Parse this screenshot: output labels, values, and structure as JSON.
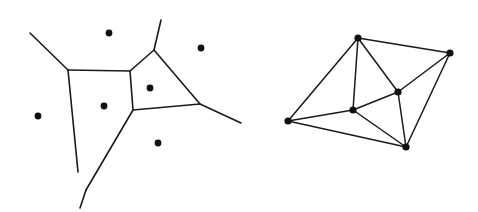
{
  "figure": {
    "background_color": "#ffffff",
    "line_color": "#1a1a1a",
    "dot_color": "#111111",
    "width": 478,
    "height": 212
  },
  "panels": [
    {
      "id": "voronoi",
      "name": "Voronoi diagram",
      "caption": ""
    },
    {
      "id": "delaunay",
      "name": "Delaunay triangulation",
      "caption": ""
    }
  ],
  "chart_data": {
    "type": "scatter",
    "xlabel": "",
    "ylabel": "",
    "xlim": [
      0,
      478
    ],
    "ylim": [
      0,
      212
    ],
    "grid": false,
    "legend": "none",
    "panels": [
      {
        "id": "voronoi",
        "label": "Voronoi diagram",
        "sites": [
          {
            "id": "s1",
            "label": "site-top",
            "x": 109,
            "y": 33,
            "r": 3.4
          },
          {
            "id": "s2",
            "label": "site-upper-right",
            "x": 201,
            "y": 48,
            "r": 3.4
          },
          {
            "id": "s3",
            "label": "site-center-right",
            "x": 150,
            "y": 88,
            "r": 3.4
          },
          {
            "id": "s4",
            "label": "site-center-left",
            "x": 104,
            "y": 106,
            "r": 3.4
          },
          {
            "id": "s5",
            "label": "site-left",
            "x": 38,
            "y": 116,
            "r": 3.4
          },
          {
            "id": "s6",
            "label": "site-bottom",
            "x": 158,
            "y": 143,
            "r": 3.4
          }
        ],
        "vertices": [
          {
            "id": "v1",
            "label": "vertex-upper-left",
            "x": 68,
            "y": 70
          },
          {
            "id": "v2",
            "label": "vertex-upper-mid",
            "x": 130,
            "y": 71
          },
          {
            "id": "v3",
            "label": "vertex-top",
            "x": 154,
            "y": 50
          },
          {
            "id": "v4",
            "label": "vertex-center",
            "x": 133,
            "y": 110
          },
          {
            "id": "v5",
            "label": "vertex-right",
            "x": 200,
            "y": 104
          },
          {
            "id": "v6",
            "label": "vertex-bottom",
            "x": 86,
            "y": 190
          }
        ],
        "edges": [
          {
            "id": "e1",
            "label": "edge-v1-v2",
            "from": [
              68,
              70
            ],
            "to": [
              130,
              71
            ]
          },
          {
            "id": "e2",
            "label": "edge-v2-v3",
            "from": [
              130,
              71
            ],
            "to": [
              154,
              50
            ]
          },
          {
            "id": "e3",
            "label": "edge-v2-v4",
            "from": [
              130,
              71
            ],
            "to": [
              133,
              110
            ]
          },
          {
            "id": "e4",
            "label": "edge-v3-v5",
            "from": [
              154,
              50
            ],
            "to": [
              200,
              104
            ]
          },
          {
            "id": "e5",
            "label": "edge-v4-v5",
            "from": [
              133,
              110
            ],
            "to": [
              200,
              104
            ]
          },
          {
            "id": "e6",
            "label": "edge-v4-v6",
            "from": [
              133,
              110
            ],
            "to": [
              86,
              190
            ]
          },
          {
            "id": "e7",
            "label": "edge-v1-v6",
            "from": [
              68,
              70
            ],
            "to": [
              78,
              172
            ]
          }
        ],
        "rays": [
          {
            "id": "r1",
            "label": "ray-upper-left",
            "from": [
              68,
              70
            ],
            "to": [
              30,
              33
            ]
          },
          {
            "id": "r2",
            "label": "ray-top",
            "from": [
              154,
              50
            ],
            "to": [
              161,
              20
            ]
          },
          {
            "id": "r3",
            "label": "ray-right",
            "from": [
              200,
              104
            ],
            "to": [
              241,
              123
            ]
          },
          {
            "id": "r4",
            "label": "ray-bottom",
            "from": [
              86,
              190
            ],
            "to": [
              80,
              208
            ]
          }
        ]
      },
      {
        "id": "delaunay",
        "label": "Delaunay triangulation",
        "vertices": [
          {
            "id": "t",
            "label": "node-top",
            "x": 358,
            "y": 38,
            "r": 3.6
          },
          {
            "id": "r",
            "label": "node-right",
            "x": 450,
            "y": 53,
            "r": 3.6
          },
          {
            "id": "mr",
            "label": "node-mid-right",
            "x": 398,
            "y": 92,
            "r": 3.6
          },
          {
            "id": "ml",
            "label": "node-mid-left",
            "x": 353,
            "y": 110,
            "r": 3.6
          },
          {
            "id": "l",
            "label": "node-left",
            "x": 288,
            "y": 121,
            "r": 3.6
          },
          {
            "id": "b",
            "label": "node-bottom",
            "x": 406,
            "y": 147,
            "r": 3.6
          }
        ],
        "edges": [
          {
            "id": "d1",
            "label": "edge-top-right",
            "from": [
              358,
              38
            ],
            "to": [
              450,
              53
            ]
          },
          {
            "id": "d2",
            "label": "edge-top-mid-right",
            "from": [
              358,
              38
            ],
            "to": [
              398,
              92
            ]
          },
          {
            "id": "d3",
            "label": "edge-top-mid-left",
            "from": [
              358,
              38
            ],
            "to": [
              353,
              110
            ]
          },
          {
            "id": "d4",
            "label": "edge-top-left",
            "from": [
              358,
              38
            ],
            "to": [
              288,
              121
            ]
          },
          {
            "id": "d5",
            "label": "edge-right-mid-right",
            "from": [
              450,
              53
            ],
            "to": [
              398,
              92
            ]
          },
          {
            "id": "d6",
            "label": "edge-right-bottom",
            "from": [
              450,
              53
            ],
            "to": [
              406,
              147
            ]
          },
          {
            "id": "d7",
            "label": "edge-mid-right-mid-left",
            "from": [
              398,
              92
            ],
            "to": [
              353,
              110
            ]
          },
          {
            "id": "d8",
            "label": "edge-mid-right-bottom",
            "from": [
              398,
              92
            ],
            "to": [
              406,
              147
            ]
          },
          {
            "id": "d9",
            "label": "edge-mid-left-left",
            "from": [
              353,
              110
            ],
            "to": [
              288,
              121
            ]
          },
          {
            "id": "d10",
            "label": "edge-mid-left-bottom",
            "from": [
              353,
              110
            ],
            "to": [
              406,
              147
            ]
          },
          {
            "id": "d11",
            "label": "edge-left-bottom",
            "from": [
              288,
              121
            ],
            "to": [
              406,
              147
            ]
          }
        ]
      }
    ]
  }
}
